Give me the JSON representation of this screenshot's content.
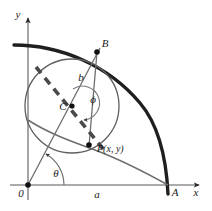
{
  "figure": {
    "kind": "geometry-diagram",
    "background_color": "#ffffff",
    "axes": {
      "x_axis_label": "x",
      "y_axis_label": "y",
      "origin_label": "0",
      "axis_color": "#8a8a8a",
      "arrow_color": "#2b2b2b"
    },
    "labels": {
      "point_a": "A",
      "point_b": "B",
      "point_c": "C",
      "point_p": "P(x, y)",
      "segment_a": "a",
      "segment_b": "b",
      "angle_theta": "θ",
      "angle_phi": "ϕ"
    },
    "colors": {
      "thick_curve": "#1f1f1f",
      "circle_outline": "#5a5a5a",
      "thin_line": "#6e6e6e",
      "dashed_line": "#4a4a4a",
      "point_fill": "#111111",
      "text": "#1a1a1a"
    },
    "geometry": {
      "origin": [
        28,
        185
      ],
      "point_a": [
        168,
        185
      ],
      "point_b": [
        97,
        52
      ],
      "point_c": [
        72,
        106
      ],
      "point_p": [
        89,
        144
      ],
      "circle_center": [
        72,
        106
      ],
      "circle_radius": 47,
      "ellipse_rx": 140,
      "ellipse_ry": 140,
      "theta_arc_radius": 36,
      "phi_arc_radius": 17
    }
  }
}
